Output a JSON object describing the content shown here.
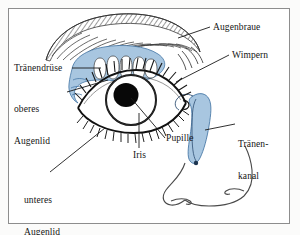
{
  "diagram": {
    "frame_color": "#8d8d8d",
    "background": "#ffffff",
    "accent_blue": "#a8c6e0",
    "ink": "#131313"
  },
  "labels": {
    "augenbraue": "Augenbraue",
    "wimpern": "Wimpern",
    "traenendruese": "Tränendrüse",
    "oberes_line1": "oberes",
    "oberes_line2": "Augenlid",
    "pupille": "Pupille",
    "iris": "Iris",
    "traenenkanal_line1": "Tränen-",
    "traenenkanal_line2": "kanal",
    "unteres_line1": "unteres",
    "unteres_line2": "Augenlid"
  },
  "parts": {
    "eyebrow": "eyebrow-hatched-arc",
    "lacrimal_gland": "lacrimal-gland-blue-lobed",
    "upper_lid": "upper-eyelid",
    "lower_lid": "lower-eyelid",
    "lashes_upper": "upper-eyelashes",
    "lashes_lower": "lower-eyelashes",
    "iris": "iris-circle",
    "pupil": "pupil-black-circle",
    "tear_duct": "tear-duct-blue-channel",
    "nose": "nose-outline"
  }
}
